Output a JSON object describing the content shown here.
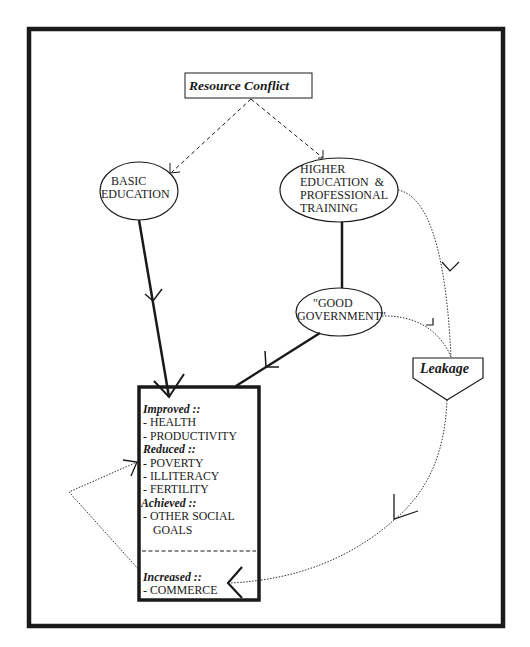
{
  "diagram": {
    "nodes": {
      "resource_conflict": {
        "label": "Resource Conflict",
        "shape": "rectangle"
      },
      "basic_education": {
        "label_lines": [
          "BASIC",
          "EDUCATION"
        ],
        "shape": "ellipse"
      },
      "higher_education": {
        "label_lines": [
          "HIGHER",
          "EDUCATION  &",
          "PROFESSIONAL",
          "TRAINING"
        ],
        "shape": "ellipse"
      },
      "good_government": {
        "label_lines": [
          "\"GOOD",
          "GOVERNMENT\""
        ],
        "shape": "ellipse"
      },
      "leakage": {
        "label": "Leakage",
        "shape": "pentagon"
      },
      "outcomes": {
        "shape": "rectangle",
        "sections": [
          {
            "heading": "Improved ::",
            "items": [
              "- HEALTH",
              "- PRODUCTIVITY"
            ]
          },
          {
            "heading": "Reduced ::",
            "items": [
              "- POVERTY",
              "- ILLITERACY",
              "- FERTILITY"
            ]
          },
          {
            "heading": "Achieved ::",
            "items": [
              "- OTHER SOCIAL",
              "GOALS"
            ]
          },
          {
            "heading": "Increased ::",
            "items": [
              "- COMMERCE"
            ]
          }
        ]
      }
    },
    "edges": [
      {
        "from": "resource_conflict",
        "to": "basic_education",
        "style": "dashed"
      },
      {
        "from": "resource_conflict",
        "to": "higher_education",
        "style": "dashed"
      },
      {
        "from": "basic_education",
        "to": "outcomes",
        "style": "solid-thick"
      },
      {
        "from": "higher_education",
        "to": "good_government",
        "style": "solid-thick"
      },
      {
        "from": "good_government",
        "to": "outcomes",
        "style": "solid-thick"
      },
      {
        "from": "higher_education",
        "to": "leakage",
        "style": "dotted"
      },
      {
        "from": "good_government",
        "to": "leakage",
        "style": "dotted"
      },
      {
        "from": "leakage",
        "to": "outcomes.commerce",
        "style": "dotted"
      },
      {
        "from": "outcomes.commerce",
        "to": "outcomes.reduced",
        "style": "dotted"
      }
    ],
    "colors": {
      "ink": "#1a1a1a",
      "background": "#ffffff"
    }
  }
}
